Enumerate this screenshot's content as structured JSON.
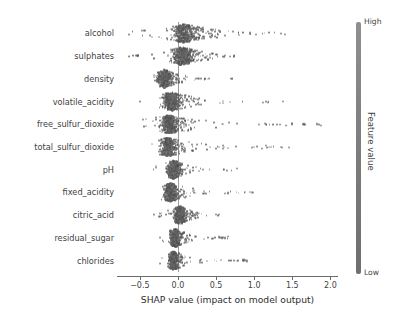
{
  "chart_data": {
    "type": "scatter",
    "plot_kind": "shap-beeswarm-summary",
    "title": "",
    "xlabel": "SHAP value (impact on model output)",
    "ylabel": "",
    "xlim": [
      -0.8,
      2.1
    ],
    "xticks": [
      -0.5,
      0.0,
      0.5,
      1.0,
      1.5,
      2.0
    ],
    "xtick_labels": [
      "−0.5",
      "0.0",
      "0.5",
      "1.0",
      "1.5",
      "2.0"
    ],
    "grid": false,
    "zero_reference_line": 0.0,
    "colorbar": {
      "title": "Feature value",
      "high_label": "High",
      "low_label": "Low",
      "position": "right",
      "high_color": "#8f8f8f",
      "low_color": "#6f6f6f"
    },
    "categories": [
      "alcohol",
      "sulphates",
      "density",
      "volatile_acidity",
      "free_sulfur_dioxide",
      "total_sulfur_dioxide",
      "pH",
      "fixed_acidity",
      "citric_acid",
      "residual_sugar",
      "chlorides"
    ],
    "series": [
      {
        "name": "alcohol",
        "min": -0.72,
        "max": 1.42,
        "core_min": -0.62,
        "core_max": 0.42,
        "density_peak": 0.08,
        "outliers": [
          0.95,
          1.02,
          1.4
        ]
      },
      {
        "name": "sulphates",
        "min": -0.66,
        "max": 0.78,
        "core_min": -0.58,
        "core_max": 0.3,
        "density_peak": 0.06,
        "outliers": [
          0.62,
          0.68,
          0.74
        ]
      },
      {
        "name": "density",
        "min": -0.34,
        "max": 0.74,
        "core_min": -0.3,
        "core_max": 0.22,
        "density_peak": -0.18,
        "outliers": []
      },
      {
        "name": "volatile_acidity",
        "min": -0.52,
        "max": 1.4,
        "core_min": -0.44,
        "core_max": 0.34,
        "density_peak": -0.08,
        "outliers": [
          1.12,
          1.18,
          1.38
        ]
      },
      {
        "name": "free_sulfur_dioxide",
        "min": -0.46,
        "max": 1.9,
        "core_min": -0.4,
        "core_max": 0.3,
        "density_peak": -0.12,
        "outliers": [
          1.06,
          1.14,
          1.34,
          1.42,
          1.5,
          1.64,
          1.82,
          1.88
        ]
      },
      {
        "name": "total_sulfur_dioxide",
        "min": -0.42,
        "max": 1.48,
        "core_min": -0.36,
        "core_max": 0.26,
        "density_peak": -0.14,
        "outliers": [
          1.1,
          1.16,
          1.36,
          1.46
        ]
      },
      {
        "name": "pH",
        "min": -0.36,
        "max": 0.8,
        "core_min": -0.3,
        "core_max": 0.24,
        "density_peak": -0.06,
        "outliers": [
          0.78
        ]
      },
      {
        "name": "fixed_acidity",
        "min": -0.34,
        "max": 1.0,
        "core_min": -0.28,
        "core_max": 0.22,
        "density_peak": -0.1,
        "outliers": [
          0.62,
          0.66,
          0.98
        ]
      },
      {
        "name": "citric_acid",
        "min": -0.32,
        "max": 0.54,
        "core_min": -0.26,
        "core_max": 0.24,
        "density_peak": 0.02,
        "outliers": [
          0.5,
          0.54
        ]
      },
      {
        "name": "residual_sugar",
        "min": -0.3,
        "max": 0.66,
        "core_min": -0.24,
        "core_max": 0.2,
        "density_peak": -0.04,
        "outliers": [
          0.54,
          0.58,
          0.62,
          0.66
        ]
      },
      {
        "name": "chlorides",
        "min": -0.26,
        "max": 0.92,
        "core_min": -0.22,
        "core_max": 0.16,
        "density_peak": -0.06,
        "outliers": [
          0.86,
          0.9
        ]
      }
    ]
  }
}
